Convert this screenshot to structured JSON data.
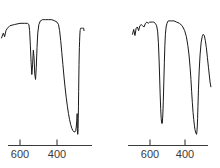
{
  "figure": {
    "title": "",
    "background_color": "#ffffff",
    "width": 220,
    "height": 168
  },
  "chart_data": [
    {
      "type": "line",
      "panel": "left",
      "title": "",
      "xlabel": "",
      "ylabel": "",
      "xlim": [
        700,
        250
      ],
      "ylim": [
        0,
        100
      ],
      "grid": false,
      "legend": null,
      "axis_direction": "reversed",
      "tick_values": [
        600,
        400
      ],
      "tick_labels": [
        "600",
        "400"
      ],
      "series": [
        {
          "name": "spectrum-left",
          "color": "#1a1a1a",
          "x": [
            700,
            690,
            683,
            676,
            668,
            655,
            630,
            600,
            575,
            560,
            552,
            548,
            544,
            540,
            536,
            532,
            528,
            524,
            520,
            516,
            512,
            508,
            504,
            498,
            490,
            478,
            462,
            445,
            428,
            412,
            400,
            392,
            386,
            380,
            374,
            368,
            362,
            356,
            350,
            344,
            338,
            332,
            326,
            320,
            314,
            308,
            303,
            299,
            296,
            293,
            291,
            290,
            289,
            288,
            287,
            286,
            285,
            284,
            283,
            282,
            281,
            280,
            279,
            278,
            277,
            276,
            275,
            274,
            272,
            270,
            268,
            266,
            264,
            262,
            260,
            258,
            256,
            254
          ],
          "y": [
            82,
            86,
            83,
            88,
            90,
            92,
            93,
            94,
            94,
            94,
            93,
            88,
            76,
            62,
            52,
            60,
            72,
            66,
            52,
            48,
            58,
            74,
            86,
            93,
            96,
            97,
            97,
            97,
            97,
            96,
            95,
            93,
            88,
            80,
            70,
            60,
            50,
            41,
            33,
            26,
            20,
            15,
            11,
            8,
            6,
            5,
            5,
            6,
            9,
            14,
            20,
            8,
            4,
            3,
            4,
            8,
            16,
            26,
            38,
            50,
            60,
            68,
            74,
            79,
            83,
            86,
            88,
            89,
            90,
            90,
            90,
            90,
            90,
            90,
            90,
            90,
            90,
            88
          ]
        }
      ]
    },
    {
      "type": "line",
      "panel": "right",
      "title": "",
      "xlabel": "",
      "ylabel": "",
      "xlim": [
        700,
        250
      ],
      "ylim": [
        0,
        100
      ],
      "grid": false,
      "legend": null,
      "axis_direction": "reversed",
      "tick_values": [
        600,
        400
      ],
      "tick_labels": [
        "600",
        "400"
      ],
      "series": [
        {
          "name": "spectrum-right",
          "color": "#1a1a1a",
          "x": [
            700,
            693,
            686,
            679,
            672,
            665,
            658,
            650,
            642,
            634,
            626,
            618,
            610,
            602,
            594,
            586,
            578,
            570,
            562,
            556,
            552,
            548,
            545,
            542,
            539,
            536,
            533,
            530,
            527,
            524,
            521,
            518,
            515,
            512,
            508,
            503,
            496,
            487,
            476,
            463,
            448,
            432,
            416,
            402,
            392,
            384,
            377,
            371,
            366,
            362,
            358,
            354,
            350,
            346,
            343,
            340,
            338,
            336,
            334,
            332,
            330,
            328,
            326,
            323,
            319,
            314,
            308,
            302,
            296,
            290,
            284,
            278,
            272,
            266,
            260,
            256,
            252
          ],
          "y": [
            85,
            89,
            84,
            90,
            91,
            88,
            92,
            93,
            92,
            91,
            94,
            95,
            94,
            95,
            95,
            95,
            95,
            94,
            92,
            87,
            78,
            64,
            50,
            36,
            24,
            16,
            12,
            12,
            18,
            30,
            46,
            62,
            76,
            85,
            91,
            94,
            96,
            96,
            96,
            96,
            95,
            94,
            92,
            88,
            83,
            76,
            68,
            58,
            48,
            38,
            29,
            21,
            15,
            10,
            7,
            5,
            4,
            4,
            3,
            5,
            9,
            16,
            26,
            40,
            55,
            68,
            78,
            83,
            85,
            84,
            80,
            74,
            66,
            58,
            50,
            45,
            42
          ]
        }
      ]
    }
  ],
  "axes": {
    "left": {
      "name": "x-axis-left",
      "ticks": [
        {
          "label": "600",
          "value": 600
        },
        {
          "label": "400",
          "value": 400
        }
      ]
    },
    "right": {
      "name": "x-axis-right",
      "ticks": [
        {
          "label": "600",
          "value": 600
        },
        {
          "label": "400",
          "value": 400
        }
      ]
    }
  },
  "colors": {
    "trace": "#1a1a1a",
    "axis": "#3a3a3a",
    "background": "#ffffff"
  }
}
